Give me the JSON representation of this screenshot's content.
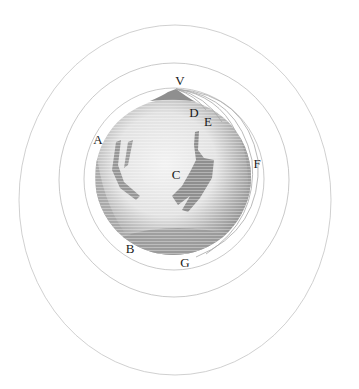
{
  "diagram": {
    "type": "newton-cannonball-orbits",
    "colors": {
      "background": "#ffffff",
      "orbit_line": "#bdbdbd",
      "earth_fill": "#9a9a9a",
      "earth_light": "#e6e6e6",
      "label_text": "#1a1a1a"
    },
    "earth": {
      "cx": 173,
      "cy": 177,
      "r": 78
    },
    "mountain_peak": {
      "x": 176,
      "y": 89
    },
    "orbits": [
      {
        "name": "inner-orbit",
        "cx": 174,
        "cy": 179,
        "rx": 90,
        "ry": 91
      },
      {
        "name": "middle-orbit",
        "cx": 174,
        "cy": 180,
        "rx": 115,
        "ry": 117
      },
      {
        "name": "outer-orbit",
        "cx": 175,
        "cy": 200,
        "rx": 156,
        "ry": 175
      }
    ],
    "labels": [
      {
        "id": "V",
        "text": "V",
        "x": 180,
        "y": 80
      },
      {
        "id": "D",
        "text": "D",
        "x": 194,
        "y": 112
      },
      {
        "id": "E",
        "text": "E",
        "x": 208,
        "y": 121
      },
      {
        "id": "A",
        "text": "A",
        "x": 98,
        "y": 139
      },
      {
        "id": "F",
        "text": "F",
        "x": 257,
        "y": 163
      },
      {
        "id": "C",
        "text": "C",
        "x": 176,
        "y": 174
      },
      {
        "id": "B",
        "text": "B",
        "x": 130,
        "y": 248
      },
      {
        "id": "G",
        "text": "G",
        "x": 185,
        "y": 262
      }
    ]
  }
}
